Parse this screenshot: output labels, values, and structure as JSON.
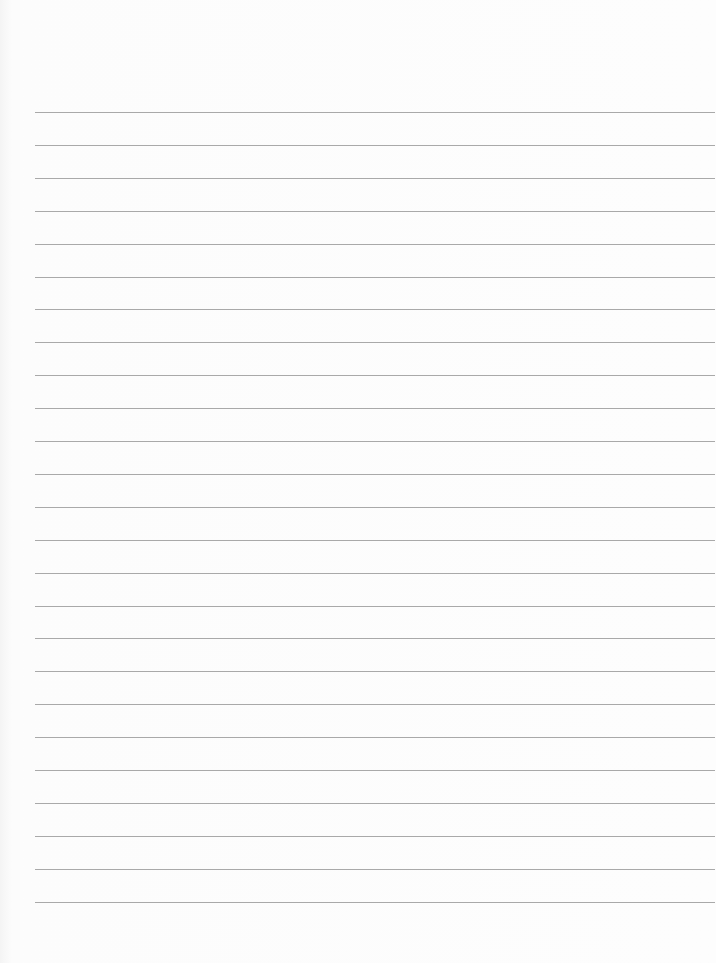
{
  "page": {
    "type": "blank lined paper",
    "background_color": "#fdfdfd",
    "line_color": "#9a9a9a",
    "line_count": 25,
    "first_line_y": 112,
    "line_spacing": 32.9,
    "line_left": 35,
    "line_right": 715
  }
}
